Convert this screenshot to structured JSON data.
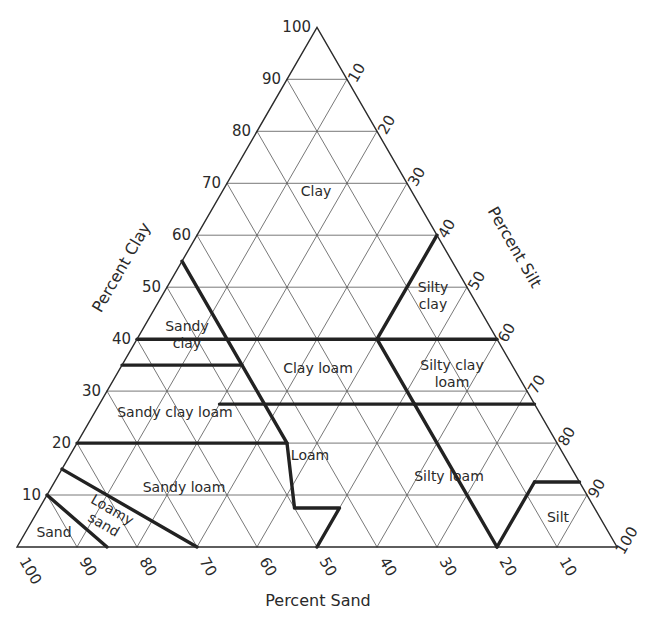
{
  "chart_data": {
    "type": "ternary",
    "title": "",
    "axes": {
      "clay": {
        "label": "Percent Clay",
        "ticks": [
          10,
          20,
          30,
          40,
          50,
          60,
          70,
          80,
          90,
          100
        ]
      },
      "silt": {
        "label": "Percent Silt",
        "ticks": [
          10,
          20,
          30,
          40,
          50,
          60,
          70,
          80,
          90,
          100
        ]
      },
      "sand": {
        "label": "Percent Sand",
        "ticks": [
          100,
          90,
          80,
          70,
          60,
          50,
          40,
          30,
          20,
          10
        ]
      }
    },
    "grid": true,
    "grid_step": 10,
    "regions": [
      {
        "name": "Clay",
        "label_lines": [
          "Clay"
        ]
      },
      {
        "name": "Silty clay",
        "label_lines": [
          "Silty",
          "clay"
        ]
      },
      {
        "name": "Sandy clay",
        "label_lines": [
          "Sandy",
          "clay"
        ]
      },
      {
        "name": "Clay loam",
        "label_lines": [
          "Clay loam"
        ]
      },
      {
        "name": "Silty clay loam",
        "label_lines": [
          "Silty clay",
          "loam"
        ]
      },
      {
        "name": "Sandy clay loam",
        "label_lines": [
          "Sandy clay loam"
        ]
      },
      {
        "name": "Loam",
        "label_lines": [
          "Loam"
        ]
      },
      {
        "name": "Silty loam",
        "label_lines": [
          "Silty loam"
        ]
      },
      {
        "name": "Sandy loam",
        "label_lines": [
          "Sandy loam"
        ]
      },
      {
        "name": "Silt",
        "label_lines": [
          "Silt"
        ]
      },
      {
        "name": "Loamy sand",
        "label_lines": [
          "Loamy",
          "sand"
        ]
      },
      {
        "name": "Sand",
        "label_lines": [
          "Sand"
        ]
      }
    ],
    "boundaries_clay_silt": [
      [
        [
          55,
          0
        ],
        [
          35,
          20
        ],
        [
          27.5,
          27.5
        ],
        [
          20,
          35
        ],
        [
          7.5,
          42.5
        ],
        [
          7.5,
          50
        ],
        [
          0,
          50
        ]
      ],
      [
        [
          40,
          0
        ],
        [
          40,
          60
        ]
      ],
      [
        [
          35,
          0
        ],
        [
          35,
          20
        ]
      ],
      [
        [
          27.5,
          20
        ],
        [
          27.5,
          72.5
        ]
      ],
      [
        [
          20,
          0
        ],
        [
          20,
          35
        ]
      ],
      [
        [
          40,
          40
        ],
        [
          27.5,
          52.5
        ]
      ],
      [
        [
          60,
          40
        ],
        [
          40,
          40
        ]
      ],
      [
        [
          27.5,
          52.5
        ],
        [
          0,
          80
        ]
      ],
      [
        [
          15,
          0
        ],
        [
          0,
          30
        ]
      ],
      [
        [
          10,
          0
        ],
        [
          0,
          15
        ]
      ],
      [
        [
          12.5,
          80
        ],
        [
          12.5,
          87.5
        ]
      ],
      [
        [
          12.5,
          80
        ],
        [
          0,
          80
        ]
      ]
    ]
  }
}
